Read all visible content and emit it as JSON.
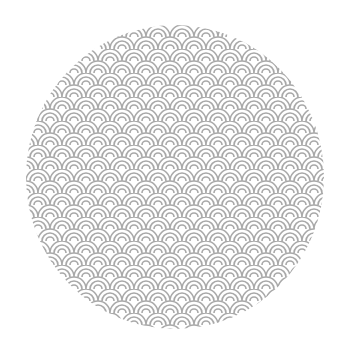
{
  "image": {
    "subject": "circular seigaiha wave pattern swatch",
    "shape": "circle",
    "pattern": "seigaiha-scales",
    "colors": {
      "background": "#ffffff",
      "stroke": "#a8a8a8",
      "fill": "#ffffff"
    },
    "pattern_metrics": {
      "scale_width_px": 24,
      "row_height_px": 12,
      "arcs_per_scale": 3
    }
  }
}
